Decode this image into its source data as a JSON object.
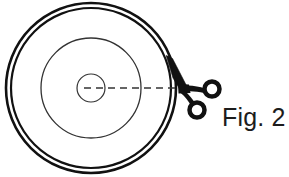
{
  "figure": {
    "caption": "Fig. 2",
    "title": "Fig. 2",
    "background_color": "#ffffff",
    "line_color": "#111111",
    "thin_line_color": "#222222",
    "scissors_color": "#111111",
    "caption_color": "#1c1c1c"
  },
  "diagram": {
    "type": "technical-line-drawing",
    "center": {
      "x": 91,
      "y": 88
    },
    "circles": [
      {
        "name": "outer-rim-outer-edge",
        "cx": 91,
        "cy": 88,
        "r": 85,
        "stroke_width": 2.6,
        "style": "solid",
        "color": "#111111"
      },
      {
        "name": "outer-rim-inner-edge",
        "cx": 91,
        "cy": 88,
        "r": 80,
        "stroke_width": 2.2,
        "style": "solid",
        "color": "#111111"
      },
      {
        "name": "middle-circle",
        "cx": 91,
        "cy": 88,
        "r": 50,
        "stroke_width": 1.3,
        "style": "solid",
        "color": "#333333"
      },
      {
        "name": "center-circle",
        "cx": 91,
        "cy": 88,
        "r": 14,
        "stroke_width": 1.2,
        "style": "solid",
        "color": "#333333"
      }
    ],
    "dashed_line": {
      "name": "radius-dashed-line",
      "x1": 84,
      "y1": 88,
      "x2": 177,
      "y2": 88,
      "stroke_width": 1.4,
      "dash_pattern": "7,5",
      "color": "#333333"
    },
    "scissors": {
      "name": "scissors",
      "pivot": {
        "x": 180,
        "y": 88
      },
      "blade_tip": {
        "x": 166,
        "y": 56
      },
      "upper_ring": {
        "cx": 212,
        "cy": 89,
        "r": 7.5,
        "stroke_width": 4.5
      },
      "lower_ring": {
        "cx": 197,
        "cy": 110,
        "r": 7.5,
        "stroke_width": 4.5
      },
      "color": "#111111",
      "cut_point": {
        "x": 175,
        "y": 76
      }
    },
    "caption_position": {
      "x": 222,
      "y": 126
    }
  }
}
